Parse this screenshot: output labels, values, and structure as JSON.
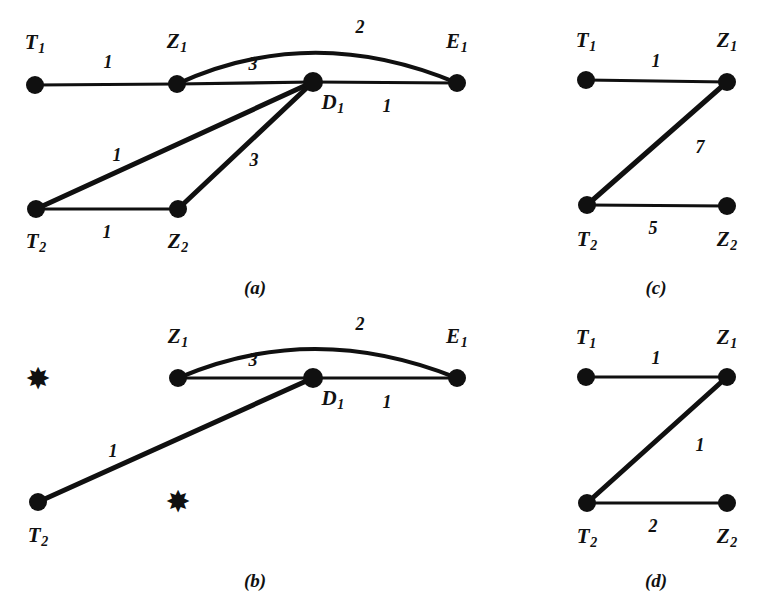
{
  "figure": {
    "background_color": "#ffffff",
    "ink_color": "#101010",
    "panels": [
      {
        "id": "a",
        "caption": "(a)",
        "caption_pos": {
          "x": 255,
          "y": 287
        },
        "nodes": [
          {
            "id": "T1",
            "base": "T",
            "sub": "1",
            "x": 35,
            "y": 85,
            "r": 9,
            "kind": "dot",
            "label_x": 35,
            "label_y": 44
          },
          {
            "id": "Z1",
            "base": "Z",
            "sub": "1",
            "x": 177,
            "y": 84,
            "r": 9,
            "kind": "dot",
            "label_x": 177,
            "label_y": 43
          },
          {
            "id": "D1",
            "base": "D",
            "sub": "1",
            "x": 313,
            "y": 82,
            "r": 10,
            "kind": "dot",
            "label_x": 333,
            "label_y": 104
          },
          {
            "id": "E1",
            "base": "E",
            "sub": "1",
            "x": 457,
            "y": 83,
            "r": 9,
            "kind": "dot",
            "label_x": 457,
            "label_y": 43
          },
          {
            "id": "T2",
            "base": "T",
            "sub": "2",
            "x": 36,
            "y": 209,
            "r": 9,
            "kind": "dot",
            "label_x": 36,
            "label_y": 243
          },
          {
            "id": "Z2",
            "base": "Z",
            "sub": "2",
            "x": 178,
            "y": 209,
            "r": 9,
            "kind": "dot",
            "label_x": 178,
            "label_y": 243
          }
        ],
        "edges": [
          {
            "from": "T1",
            "to": "Z1",
            "weight": "1",
            "label_x": 108,
            "label_y": 62,
            "curve": null,
            "width": "thin"
          },
          {
            "from": "Z1",
            "to": "D1",
            "weight": "3",
            "label_x": 253,
            "label_y": 64,
            "curve": null,
            "width": "thin"
          },
          {
            "from": "Z1",
            "to": "E1",
            "weight": "2",
            "label_x": 360,
            "label_y": 27,
            "curve": {
              "cx": 312,
              "cy": 22
            },
            "width": "med"
          },
          {
            "from": "D1",
            "to": "E1",
            "weight": "1",
            "label_x": 387,
            "label_y": 106,
            "curve": null,
            "width": "thin"
          },
          {
            "from": "T2",
            "to": "D1",
            "weight": "1",
            "label_x": 117,
            "label_y": 155,
            "curve": null,
            "width": "thick"
          },
          {
            "from": "T2",
            "to": "Z2",
            "weight": "1",
            "label_x": 107,
            "label_y": 232,
            "curve": null,
            "width": "thin"
          },
          {
            "from": "Z2",
            "to": "D1",
            "weight": "3",
            "label_x": 254,
            "label_y": 160,
            "curve": null,
            "width": "thick"
          }
        ]
      },
      {
        "id": "b",
        "caption": "(b)",
        "caption_pos": {
          "x": 255,
          "y": 580
        },
        "nodes": [
          {
            "id": "star1",
            "base": "",
            "sub": "",
            "x": 38,
            "y": 379,
            "r": 0,
            "kind": "star",
            "label_x": 0,
            "label_y": 0,
            "glyph": "✸"
          },
          {
            "id": "Z1",
            "base": "Z",
            "sub": "1",
            "x": 178,
            "y": 378,
            "r": 9,
            "kind": "dot",
            "label_x": 178,
            "label_y": 338
          },
          {
            "id": "D1",
            "base": "D",
            "sub": "1",
            "x": 313,
            "y": 378,
            "r": 10,
            "kind": "dot",
            "label_x": 333,
            "label_y": 400
          },
          {
            "id": "E1",
            "base": "E",
            "sub": "1",
            "x": 457,
            "y": 378,
            "r": 9,
            "kind": "dot",
            "label_x": 457,
            "label_y": 338
          },
          {
            "id": "T2",
            "base": "T",
            "sub": "2",
            "x": 38,
            "y": 502,
            "r": 9,
            "kind": "dot",
            "label_x": 38,
            "label_y": 537
          },
          {
            "id": "star2",
            "base": "",
            "sub": "",
            "x": 178,
            "y": 502,
            "r": 0,
            "kind": "star",
            "label_x": 0,
            "label_y": 0,
            "glyph": "✸"
          }
        ],
        "edges": [
          {
            "from": "Z1",
            "to": "D1",
            "weight": "3",
            "label_x": 253,
            "label_y": 360,
            "curve": null,
            "width": "thin"
          },
          {
            "from": "Z1",
            "to": "E1",
            "weight": "2",
            "label_x": 360,
            "label_y": 324,
            "curve": {
              "cx": 313,
              "cy": 320
            },
            "width": "med"
          },
          {
            "from": "D1",
            "to": "E1",
            "weight": "1",
            "label_x": 387,
            "label_y": 402,
            "curve": null,
            "width": "thin"
          },
          {
            "from": "T2",
            "to": "D1",
            "weight": "1",
            "label_x": 113,
            "label_y": 451,
            "curve": null,
            "width": "thick"
          }
        ]
      },
      {
        "id": "c",
        "caption": "(c)",
        "caption_pos": {
          "x": 656,
          "y": 287
        },
        "nodes": [
          {
            "id": "T1",
            "base": "T",
            "sub": "1",
            "x": 586,
            "y": 80,
            "r": 9,
            "kind": "dot",
            "label_x": 586,
            "label_y": 42
          },
          {
            "id": "Z1",
            "base": "Z",
            "sub": "1",
            "x": 727,
            "y": 82,
            "r": 9,
            "kind": "dot",
            "label_x": 727,
            "label_y": 42
          },
          {
            "id": "T2",
            "base": "T",
            "sub": "2",
            "x": 587,
            "y": 205,
            "r": 9,
            "kind": "dot",
            "label_x": 587,
            "label_y": 241
          },
          {
            "id": "Z2",
            "base": "Z",
            "sub": "2",
            "x": 727,
            "y": 206,
            "r": 9,
            "kind": "dot",
            "label_x": 727,
            "label_y": 241
          }
        ],
        "edges": [
          {
            "from": "T1",
            "to": "Z1",
            "weight": "1",
            "label_x": 656,
            "label_y": 61,
            "curve": null,
            "width": "thin"
          },
          {
            "from": "Z1",
            "to": "T2",
            "weight": "7",
            "label_x": 700,
            "label_y": 147,
            "curve": null,
            "width": "thick"
          },
          {
            "from": "T2",
            "to": "Z2",
            "weight": "5",
            "label_x": 653,
            "label_y": 228,
            "curve": null,
            "width": "thin"
          }
        ]
      },
      {
        "id": "d",
        "caption": "(d)",
        "caption_pos": {
          "x": 656,
          "y": 580
        },
        "nodes": [
          {
            "id": "T1",
            "base": "T",
            "sub": "1",
            "x": 586,
            "y": 377,
            "r": 9,
            "kind": "dot",
            "label_x": 586,
            "label_y": 339
          },
          {
            "id": "Z1",
            "base": "Z",
            "sub": "1",
            "x": 727,
            "y": 377,
            "r": 9,
            "kind": "dot",
            "label_x": 727,
            "label_y": 339
          },
          {
            "id": "T2",
            "base": "T",
            "sub": "2",
            "x": 587,
            "y": 503,
            "r": 9,
            "kind": "dot",
            "label_x": 587,
            "label_y": 538
          },
          {
            "id": "Z2",
            "base": "Z",
            "sub": "2",
            "x": 727,
            "y": 503,
            "r": 9,
            "kind": "dot",
            "label_x": 727,
            "label_y": 538
          }
        ],
        "edges": [
          {
            "from": "T1",
            "to": "Z1",
            "weight": "1",
            "label_x": 656,
            "label_y": 358,
            "curve": null,
            "width": "thin"
          },
          {
            "from": "Z1",
            "to": "T2",
            "weight": "1",
            "label_x": 700,
            "label_y": 445,
            "curve": null,
            "width": "thick"
          },
          {
            "from": "T2",
            "to": "Z2",
            "weight": "2",
            "label_x": 653,
            "label_y": 526,
            "curve": null,
            "width": "thin"
          }
        ]
      }
    ]
  },
  "graph_data": {
    "type": "diagram",
    "description": "Four weighted undirected graphs labelled (a), (b), (c), (d) with nodes T1, Z1, D1, E1, T2, Z2.",
    "panels": {
      "a": {
        "nodes": [
          "T1",
          "Z1",
          "D1",
          "E1",
          "T2",
          "Z2"
        ],
        "edges": [
          {
            "u": "T1",
            "v": "Z1",
            "w": 1
          },
          {
            "u": "Z1",
            "v": "D1",
            "w": 3
          },
          {
            "u": "Z1",
            "v": "E1",
            "w": 2
          },
          {
            "u": "D1",
            "v": "E1",
            "w": 1
          },
          {
            "u": "T2",
            "v": "D1",
            "w": 1
          },
          {
            "u": "T2",
            "v": "Z2",
            "w": 1
          },
          {
            "u": "Z2",
            "v": "D1",
            "w": 3
          }
        ]
      },
      "b": {
        "nodes": [
          "Z1",
          "D1",
          "E1",
          "T2"
        ],
        "removed_nodes": [
          "T1",
          "Z2"
        ],
        "edges": [
          {
            "u": "Z1",
            "v": "D1",
            "w": 3
          },
          {
            "u": "Z1",
            "v": "E1",
            "w": 2
          },
          {
            "u": "D1",
            "v": "E1",
            "w": 1
          },
          {
            "u": "T2",
            "v": "D1",
            "w": 1
          }
        ]
      },
      "c": {
        "nodes": [
          "T1",
          "Z1",
          "T2",
          "Z2"
        ],
        "edges": [
          {
            "u": "T1",
            "v": "Z1",
            "w": 1
          },
          {
            "u": "Z1",
            "v": "T2",
            "w": 7
          },
          {
            "u": "T2",
            "v": "Z2",
            "w": 5
          }
        ]
      },
      "d": {
        "nodes": [
          "T1",
          "Z1",
          "T2",
          "Z2"
        ],
        "edges": [
          {
            "u": "T1",
            "v": "Z1",
            "w": 1
          },
          {
            "u": "Z1",
            "v": "T2",
            "w": 1
          },
          {
            "u": "T2",
            "v": "Z2",
            "w": 2
          }
        ]
      }
    }
  }
}
